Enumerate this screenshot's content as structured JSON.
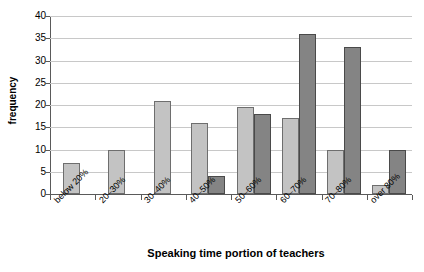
{
  "chart_data": {
    "type": "bar",
    "title": "",
    "subtitle": "",
    "xlabel": "Speaking time portion of teachers",
    "ylabel": "frequency",
    "categories": [
      "below 20%",
      "20–30%",
      "30–40%",
      "40–50%",
      "50–60%",
      "60–70%",
      "70–80%",
      "over 80%"
    ],
    "series": [
      {
        "name": "series-light",
        "color": "#c3c3c3",
        "values": [
          7,
          10,
          21,
          16,
          19.5,
          17,
          10,
          2
        ]
      },
      {
        "name": "series-dark",
        "color": "#848484",
        "values": [
          null,
          null,
          null,
          4,
          18,
          36,
          33,
          10
        ]
      }
    ],
    "ylim": [
      0,
      40
    ],
    "ytick_labels": [
      "40",
      "35",
      "30",
      "25",
      "20",
      "15",
      "10",
      "5",
      "0"
    ],
    "ytick_values": [
      40,
      35,
      30,
      25,
      20,
      15,
      10,
      5,
      0
    ],
    "ystep": 5,
    "grid": "horizontal",
    "legend": "none",
    "axis_color": "#5a5a5a",
    "gridline_color": "#c8c8c8"
  }
}
